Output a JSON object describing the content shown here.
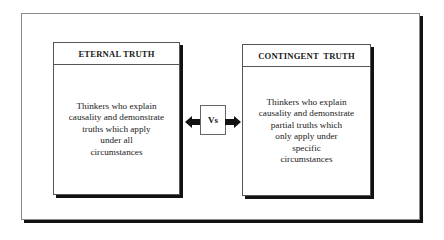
{
  "diagram": {
    "left": {
      "title": "ETERNAL TRUTH",
      "lines": [
        "Thinkers who explain",
        "causality and demonstrate",
        "truths which apply",
        "under all",
        "circumstances"
      ]
    },
    "right": {
      "title": "CONTINGENT  TRUTH",
      "lines": [
        "Thinkers who explain",
        "causality and demonstrate",
        "partial truths which",
        "only apply under",
        "specific",
        "circumstances"
      ]
    },
    "connector": {
      "label": "Vs",
      "left_arrow_icon": "arrow-left-icon",
      "right_arrow_icon": "arrow-right-icon"
    }
  }
}
